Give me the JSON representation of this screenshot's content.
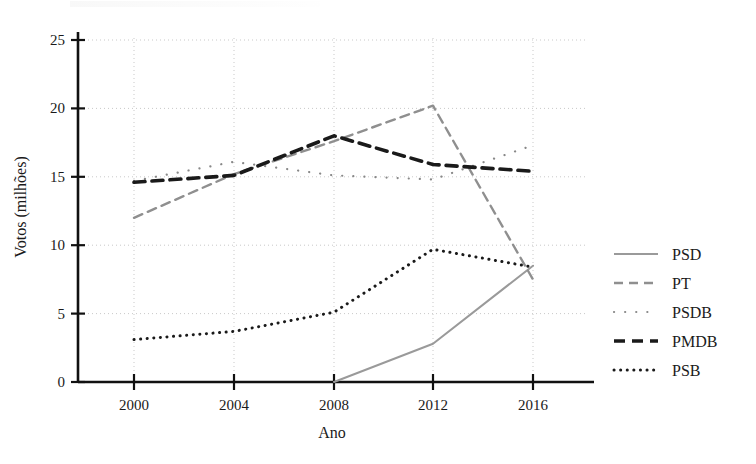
{
  "chart_data": {
    "type": "line",
    "title": "",
    "xlabel": "Ano",
    "ylabel": "Votos (milhões)",
    "x": [
      2000,
      2004,
      2008,
      2012,
      2016
    ],
    "xlim": [
      1998,
      2018
    ],
    "ylim": [
      0,
      25
    ],
    "xticks": [
      "2000",
      "2004",
      "2008",
      "2012",
      "2016"
    ],
    "yticks": [
      "0",
      "5",
      "10",
      "15",
      "20",
      "25"
    ],
    "grid": true,
    "legend_position": "right",
    "series": [
      {
        "name": "PSD",
        "values": [
          null,
          null,
          0.0,
          2.8,
          8.5
        ],
        "color": "#9a9a9a",
        "style": "solid",
        "width": 2.0
      },
      {
        "name": "PT",
        "values": [
          12.0,
          15.2,
          17.6,
          20.2,
          7.5
        ],
        "color": "#8f8f8f",
        "style": "dashed",
        "width": 2.4
      },
      {
        "name": "PSDB",
        "values": [
          14.7,
          16.1,
          15.1,
          14.8,
          17.3
        ],
        "color": "#888888",
        "style": "dotted-marker",
        "width": 2.2
      },
      {
        "name": "PMDB",
        "values": [
          14.6,
          15.1,
          18.0,
          15.9,
          15.4
        ],
        "color": "#1a1a1a",
        "style": "heavy-dashed",
        "width": 3.6
      },
      {
        "name": "PSB",
        "values": [
          3.1,
          3.7,
          5.1,
          9.7,
          8.4
        ],
        "color": "#1a1a1a",
        "style": "fine-dotted",
        "width": 3.0
      }
    ]
  },
  "legend": {
    "entries": [
      {
        "label": "PSD"
      },
      {
        "label": "PT"
      },
      {
        "label": "PSDB"
      },
      {
        "label": "PMDB"
      },
      {
        "label": "PSB"
      }
    ]
  }
}
